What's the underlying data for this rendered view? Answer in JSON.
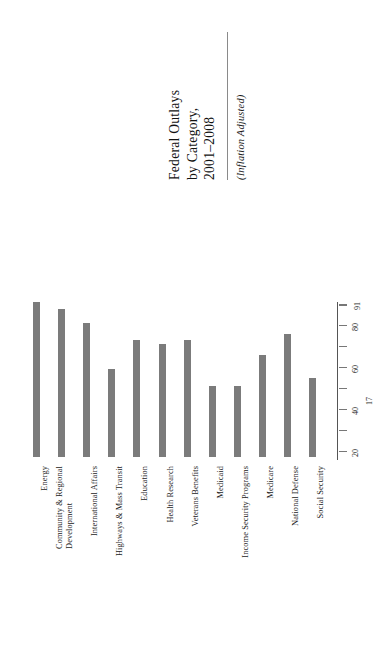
{
  "chart_data": {
    "type": "bar",
    "title": "Federal Outlays by Category, 2001–2008",
    "title_lines": [
      "Federal Outlays",
      "by Category,",
      "2001–2008"
    ],
    "subtitle": "(Inflation Adjusted)",
    "orientation": "rotated-90",
    "xlabel": "",
    "ylabel": "",
    "ylim": [
      17,
      91
    ],
    "grid": false,
    "legend": "none",
    "bar_color": "#7b7b7b",
    "axis_color": "#555555",
    "tick_values": [
      20,
      40,
      60,
      80
    ],
    "tick_labels": [
      "20",
      "40",
      "60",
      "80"
    ],
    "axis_min_label": "17",
    "axis_max_label": "91",
    "minor_tick_values": [
      30,
      50,
      70,
      90
    ],
    "categories": [
      "Energy",
      "Community & Regional Development",
      "International Affairs",
      "Highways & Mass Transit",
      "Education",
      "Health Research",
      "Veterans Benefits",
      "Medicaid",
      "Income Security Programs",
      "Medicare",
      "National Defense",
      "Social Security"
    ],
    "category_lines": [
      [
        "Energy"
      ],
      [
        "Community & Regional",
        "Development"
      ],
      [
        "International Affairs"
      ],
      [
        "Highways & Mass Transit"
      ],
      [
        "Education"
      ],
      [
        "Health Research"
      ],
      [
        "Veterans Benefits"
      ],
      [
        "Medicaid"
      ],
      [
        "Income Security Programs"
      ],
      [
        "Medicare"
      ],
      [
        "National Defense"
      ],
      [
        "Social Security"
      ]
    ],
    "values": [
      91,
      88,
      81,
      59,
      73,
      71,
      73,
      51,
      51,
      66,
      76,
      55
    ]
  }
}
